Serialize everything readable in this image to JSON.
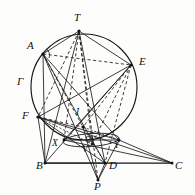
{
  "figure": {
    "canvas": {
      "width": 195,
      "height": 195
    },
    "background_color": "#fdfdfc",
    "ink_color": "#1a1a1a",
    "circle": {
      "cx": 84,
      "cy": 87,
      "r": 53
    },
    "inner_ellipse": {
      "cx": 91,
      "cy": 140,
      "rx": 28,
      "ry": 6.5,
      "rotation": -4
    },
    "points": {
      "T": {
        "x": 79,
        "y": 31,
        "label": "T",
        "label_x": 74,
        "label_y": 12
      },
      "A": {
        "x": 43,
        "y": 54,
        "label": "A",
        "label_x": 27,
        "label_y": 40
      },
      "E": {
        "x": 131,
        "y": 65,
        "label": "E",
        "label_x": 139,
        "label_y": 56
      },
      "G": {
        "x": 33,
        "y": 88,
        "label": "Γ",
        "label_x": 17,
        "label_y": 76
      },
      "F": {
        "x": 38,
        "y": 117,
        "label": "F",
        "label_x": 22,
        "label_y": 110
      },
      "I": {
        "x": 83,
        "y": 127,
        "label": "I",
        "label_x": 76,
        "label_y": 108
      },
      "X": {
        "x": 64,
        "y": 140,
        "label": "X",
        "label_x": 52,
        "label_y": 139
      },
      "V": {
        "x": 92,
        "y": 144,
        "label": "V",
        "label_x": 82,
        "label_y": 145
      },
      "Y": {
        "x": 119,
        "y": 140,
        "label": "Y",
        "label_x": 114,
        "label_y": 141
      },
      "B": {
        "x": 45,
        "y": 163,
        "label": "B",
        "label_x": 36,
        "label_y": 160
      },
      "D": {
        "x": 105,
        "y": 163,
        "label": "D",
        "label_x": 109,
        "label_y": 160
      },
      "C": {
        "x": 172,
        "y": 163,
        "label": "C",
        "label_x": 175,
        "label_y": 160
      },
      "P": {
        "x": 98,
        "y": 180,
        "label": "P",
        "label_x": 94,
        "label_y": 181
      }
    },
    "solid_segments": [
      [
        "A",
        "T"
      ],
      [
        "A",
        "B"
      ],
      [
        "A",
        "D"
      ],
      [
        "A",
        "P"
      ],
      [
        "A",
        "Y"
      ],
      [
        "T",
        "E"
      ],
      [
        "T",
        "B"
      ],
      [
        "T",
        "D"
      ],
      [
        "E",
        "F"
      ],
      [
        "E",
        "X"
      ],
      [
        "E",
        "B"
      ],
      [
        "F",
        "B"
      ],
      [
        "F",
        "Y"
      ],
      [
        "F",
        "C"
      ],
      [
        "F",
        "D"
      ],
      [
        "B",
        "C"
      ],
      [
        "B",
        "D"
      ],
      [
        "X",
        "Y"
      ],
      [
        "X",
        "C"
      ],
      [
        "D",
        "P"
      ],
      [
        "P",
        "Y"
      ],
      [
        "Y",
        "C"
      ],
      [
        "I",
        "P"
      ]
    ],
    "dashed_segments": [
      [
        "T",
        "F"
      ],
      [
        "T",
        "X"
      ],
      [
        "T",
        "V"
      ],
      [
        "T",
        "P"
      ],
      [
        "A",
        "E"
      ],
      [
        "A",
        "I"
      ],
      [
        "E",
        "V"
      ],
      [
        "E",
        "D"
      ],
      [
        "E",
        "I"
      ],
      [
        "F",
        "I"
      ],
      [
        "F",
        "V"
      ],
      [
        "I",
        "Y"
      ],
      [
        "I",
        "D"
      ]
    ],
    "marks": {
      "angle_at_A": true,
      "right_angle_at_V": true,
      "vertex_dots": [
        "T",
        "A",
        "E",
        "F",
        "I",
        "X",
        "V",
        "Y",
        "B",
        "D",
        "C",
        "P"
      ]
    }
  }
}
